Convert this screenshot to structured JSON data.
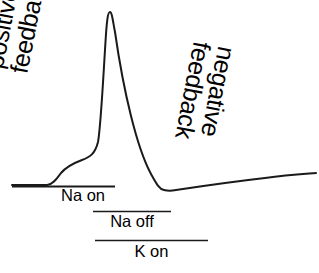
{
  "figure": {
    "background_color": "#ffffff",
    "stroke_color": "#1a1a1a"
  },
  "annotations": {
    "positive_feedback": {
      "line1": "positive",
      "line2": "feedback",
      "rotation_deg": -79
    },
    "negative_feedback": {
      "line1": "negative",
      "line2": "feedback",
      "rotation_deg": 101
    }
  },
  "phase_bars": [
    {
      "label": "Na on",
      "x_start": 12,
      "x_end": 115,
      "y": 186
    },
    {
      "label": "Na off",
      "x_start": 93,
      "x_end": 171,
      "y": 211
    },
    {
      "label": "K on",
      "x_start": 95,
      "x_end": 208,
      "y": 240
    }
  ],
  "chart_data": {
    "type": "line",
    "title": "",
    "xlabel": "",
    "ylabel": "",
    "grid": false,
    "legend": "none",
    "series": [
      {
        "name": "membrane-potential-trace",
        "description": "Action potential waveform: flat resting baseline, slow depolarizing foot, sharp rising phase to peak, steep repolarization, undershoot trough, slow recovery tail.",
        "points": [
          [
            12,
            185
          ],
          [
            48,
            185
          ],
          [
            56,
            178
          ],
          [
            64,
            170
          ],
          [
            74,
            164
          ],
          [
            86,
            159
          ],
          [
            94,
            150
          ],
          [
            100,
            120
          ],
          [
            104,
            70
          ],
          [
            107,
            18
          ],
          [
            110,
            12
          ],
          [
            114,
            22
          ],
          [
            120,
            55
          ],
          [
            128,
            95
          ],
          [
            138,
            132
          ],
          [
            148,
            162
          ],
          [
            156,
            180
          ],
          [
            163,
            190
          ],
          [
            172,
            191
          ],
          [
            190,
            188
          ],
          [
            215,
            184
          ],
          [
            245,
            180
          ],
          [
            280,
            176
          ],
          [
            315,
            173
          ]
        ]
      }
    ]
  }
}
